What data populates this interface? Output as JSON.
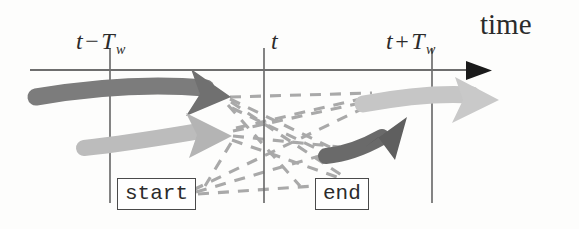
{
  "figure": {
    "axis": {
      "title": "time",
      "tick_labels": [
        {
          "base": "t",
          "operator": "−",
          "term": "T",
          "subscript": "w",
          "full": "t − T_w"
        },
        {
          "base": "t",
          "operator": "",
          "term": "",
          "subscript": "",
          "full": "t"
        },
        {
          "base": "t",
          "operator": "+",
          "term": "T",
          "subscript": "w",
          "full": "t + T_w"
        }
      ],
      "line_color": "#6e6e6e",
      "arrowhead_color": "#1a1a1a"
    },
    "boxes": [
      {
        "label": "start"
      },
      {
        "label": "end"
      }
    ],
    "tracks": [
      {
        "name": "incoming-dark-track",
        "shade": "dark",
        "color": "#7b7b7b"
      },
      {
        "name": "incoming-light-track",
        "shade": "light",
        "color": "#b9b9b9"
      },
      {
        "name": "outgoing-light-track",
        "shade": "light",
        "color": "#c4c4c4"
      },
      {
        "name": "outgoing-dark-track",
        "shade": "dark",
        "color": "#6b6b6b"
      }
    ],
    "association_lines": {
      "style": "dashed",
      "color": "#a9a9a9"
    }
  }
}
